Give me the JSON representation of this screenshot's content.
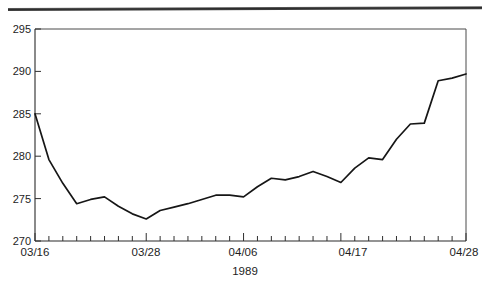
{
  "figure": {
    "background_color": "#ffffff",
    "ink_color": "#161616",
    "top_rule_present": "true"
  },
  "chart_data": {
    "type": "line",
    "title": "",
    "subtitle": "",
    "xlabel": "1989",
    "ylabel": "",
    "ylim": [
      270,
      295
    ],
    "xlim": [
      "03/16",
      "04/28"
    ],
    "grid": "off",
    "legend": "none",
    "y_ticks": [
      270,
      275,
      280,
      285,
      290,
      295
    ],
    "y_tick_labels": [
      "270",
      "275",
      "280",
      "285",
      "290",
      "295"
    ],
    "x_tick_labels": [
      "03/16",
      "03/28",
      "04/06",
      "04/17",
      "04/28"
    ],
    "x_tick_label_indices": [
      0,
      8,
      15,
      22,
      31
    ],
    "x_minor_tick_count": 32,
    "x": [
      "03/16",
      "03/17",
      "03/20",
      "03/21",
      "03/22",
      "03/23",
      "03/24",
      "03/27",
      "03/28",
      "03/29",
      "03/30",
      "03/31",
      "04/03",
      "04/04",
      "04/05",
      "04/06",
      "04/07",
      "04/10",
      "04/11",
      "04/12",
      "04/13",
      "04/14",
      "04/17",
      "04/18",
      "04/19",
      "04/20",
      "04/21",
      "04/24",
      "04/25",
      "04/26",
      "04/27",
      "04/28"
    ],
    "series": [
      {
        "name": "index",
        "values": [
          285.0,
          279.6,
          276.8,
          274.4,
          274.9,
          275.2,
          274.1,
          273.2,
          272.6,
          273.6,
          274.0,
          274.4,
          274.9,
          275.4,
          275.4,
          275.2,
          276.4,
          277.4,
          277.2,
          277.6,
          278.2,
          277.6,
          276.9,
          278.6,
          279.8,
          279.6,
          282.0,
          283.8,
          283.9,
          288.9,
          289.2,
          289.7
        ]
      }
    ],
    "drawn_points": [
      [
        35,
        111
      ],
      [
        49,
        157
      ],
      [
        62,
        181
      ],
      [
        76,
        201
      ],
      [
        90,
        197
      ],
      [
        104,
        194
      ],
      [
        118,
        204
      ],
      [
        131,
        211
      ],
      [
        145,
        216
      ],
      [
        159,
        208
      ],
      [
        173,
        204
      ],
      [
        187,
        201
      ],
      [
        200,
        197
      ],
      [
        214,
        192
      ],
      [
        228,
        192
      ],
      [
        242,
        194
      ],
      [
        256,
        184
      ],
      [
        269,
        176
      ],
      [
        283,
        178
      ],
      [
        297,
        174
      ],
      [
        311,
        169
      ],
      [
        325,
        174
      ],
      [
        338,
        180
      ],
      [
        352,
        166
      ],
      [
        366,
        155
      ],
      [
        380,
        157
      ],
      [
        394,
        137
      ],
      [
        407,
        121
      ],
      [
        421,
        120
      ],
      [
        435,
        78
      ],
      [
        449,
        75
      ],
      [
        466,
        71
      ]
    ]
  },
  "axis": {
    "y_label_x": 30,
    "x_axis_caption": "1989"
  }
}
